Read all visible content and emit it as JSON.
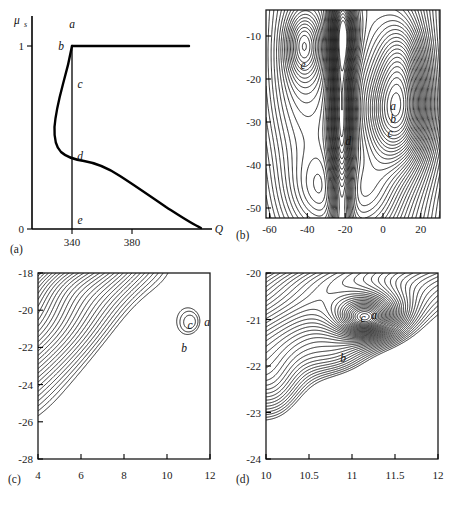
{
  "figure": {
    "panel_count": 4,
    "background": "#ffffff",
    "ink": "#1a1a1a"
  },
  "panels": {
    "a": {
      "tag": "(a)",
      "type": "line",
      "xlabel": "Q",
      "ylabel": "μ",
      "ylabel_sub": "s",
      "xticks": [
        "340",
        "380"
      ],
      "xtick_values": [
        340,
        380
      ],
      "yticks": [
        "0",
        "1"
      ],
      "ytick_values": [
        0,
        1
      ],
      "xlim": [
        300,
        420
      ],
      "ylim": [
        0,
        1.08
      ],
      "labels": [
        {
          "text": "a",
          "x": 340,
          "y": 1.06
        },
        {
          "text": "b",
          "x": 331,
          "y": 0.985
        },
        {
          "text": "c",
          "x": 344,
          "y": 0.8
        },
        {
          "text": "d",
          "x": 344,
          "y": 0.345
        },
        {
          "text": "e",
          "x": 344,
          "y": 0.055
        }
      ],
      "series": [
        {
          "name": "upper-branch-plateau",
          "comment": "mu_s = 1 plateau from Q=340 to right edge",
          "points": [
            [
              340,
              1.0
            ],
            [
              418,
              1.0
            ]
          ]
        },
        {
          "name": "s-shaped-solution-branch",
          "comment": "S-curve: from (340,1) descending left then right down to (413,0)",
          "points": [
            [
              340,
              1.0
            ],
            [
              338.6,
              0.95
            ],
            [
              336.5,
              0.88
            ],
            [
              334.5,
              0.82
            ],
            [
              332.0,
              0.755
            ],
            [
              329.5,
              0.68
            ],
            [
              327.8,
              0.6
            ],
            [
              326.8,
              0.52
            ],
            [
              326.6,
              0.455
            ],
            [
              327.4,
              0.41
            ],
            [
              329.2,
              0.375
            ],
            [
              332.0,
              0.352
            ],
            [
              335.5,
              0.337
            ],
            [
              340.0,
              0.327
            ],
            [
              345.5,
              0.305
            ],
            [
              351.0,
              0.277
            ],
            [
              357.0,
              0.245
            ],
            [
              363.5,
              0.212
            ],
            [
              370.5,
              0.178
            ],
            [
              378.0,
              0.143
            ],
            [
              386.0,
              0.11
            ],
            [
              394.0,
              0.078
            ],
            [
              401.5,
              0.049
            ],
            [
              407.5,
              0.026
            ],
            [
              411.5,
              0.01
            ],
            [
              413.5,
              0.0
            ]
          ]
        },
        {
          "name": "vertical-line-at-Q340",
          "comment": "vertical reference at Q = 340",
          "points": [
            [
              340,
              0.0
            ],
            [
              340,
              1.0
            ]
          ]
        }
      ]
    },
    "b": {
      "tag": "(b)",
      "type": "contour",
      "xlim": [
        -62,
        30
      ],
      "ylim": [
        -52,
        -4
      ],
      "xticks": [
        "-60",
        "-40",
        "-20",
        "0",
        "20"
      ],
      "xtick_values": [
        -60,
        -40,
        -20,
        0,
        20
      ],
      "yticks": [
        "-10",
        "-20",
        "-30",
        "-40",
        "-50"
      ],
      "ytick_values": [
        -10,
        -20,
        -30,
        -40,
        -50
      ],
      "labels": [
        {
          "text": "e",
          "x": -42.5,
          "y": -11.8
        },
        {
          "text": "a",
          "x": 7.5,
          "y": -21.5
        },
        {
          "text": "b",
          "x": 7.5,
          "y": -24.5
        },
        {
          "text": "c",
          "x": 6.0,
          "y": -27.8
        },
        {
          "text": "d",
          "x": -17.5,
          "y": -29.5
        }
      ]
    },
    "c": {
      "tag": "(c)",
      "type": "contour",
      "xlim": [
        4,
        12
      ],
      "ylim": [
        -28,
        -18
      ],
      "xticks": [
        "4",
        "6",
        "8",
        "10",
        "12"
      ],
      "xtick_values": [
        4,
        6,
        8,
        10,
        12
      ],
      "yticks": [
        "-18",
        "-20",
        "-22",
        "-24",
        "-26",
        "-28"
      ],
      "ytick_values": [
        -18,
        -20,
        -22,
        -24,
        -26,
        -28
      ],
      "labels": [
        {
          "text": "c",
          "x": 11.05,
          "y": -20.95
        },
        {
          "text": "a",
          "x": 11.85,
          "y": -20.8
        },
        {
          "text": "b",
          "x": 10.75,
          "y": -22.2
        }
      ]
    },
    "d": {
      "tag": "(d)",
      "type": "contour",
      "xlim": [
        10,
        12
      ],
      "ylim": [
        -24,
        -20
      ],
      "xticks": [
        "10",
        "10.5",
        "11",
        "11.5",
        "12"
      ],
      "xtick_values": [
        10,
        10.5,
        11,
        11.5,
        12
      ],
      "yticks": [
        "-20",
        "-21",
        "-22",
        "-23",
        "-24"
      ],
      "ytick_values": [
        -20,
        -21,
        -22,
        -23,
        -24
      ],
      "labels": [
        {
          "text": "c",
          "x": 11.13,
          "y": -20.93
        },
        {
          "text": "a",
          "x": 11.25,
          "y": -20.88
        },
        {
          "text": "b",
          "x": 10.9,
          "y": -21.78
        }
      ]
    }
  },
  "chart_data": [
    {
      "type": "line",
      "title": "(a)",
      "xlabel": "Q",
      "ylabel": "mu_s",
      "xlim": [
        300,
        420
      ],
      "ylim": [
        0,
        1.08
      ],
      "xticks": [
        340,
        380
      ],
      "yticks": [
        0,
        1
      ],
      "grid": false,
      "legend": "none",
      "annotations": [
        "a",
        "b",
        "c",
        "d",
        "e"
      ],
      "series": [
        {
          "name": "plateau",
          "x": [
            340,
            418
          ],
          "y": [
            1,
            1
          ]
        },
        {
          "name": "S-branch",
          "x": [
            340,
            326.6,
            340,
            370.5,
            413.5
          ],
          "y": [
            1.0,
            0.455,
            0.327,
            0.178,
            0.0
          ]
        },
        {
          "name": "Q=340 vertical",
          "x": [
            340,
            340
          ],
          "y": [
            0,
            1
          ]
        }
      ]
    },
    {
      "type": "contour",
      "title": "(b)",
      "xlabel": "",
      "ylabel": "",
      "xlim": [
        -62,
        30
      ],
      "ylim": [
        -52,
        -4
      ],
      "xticks": [
        -60,
        -40,
        -20,
        0,
        20
      ],
      "yticks": [
        -10,
        -20,
        -30,
        -40,
        -50
      ],
      "grid": false,
      "legend": "none",
      "annotations": [
        "e",
        "a",
        "b",
        "c",
        "d"
      ],
      "extrema": [
        {
          "label": "e",
          "x": -42.5,
          "y": -11.8,
          "kind": "local-extremum"
        },
        {
          "label": "a",
          "x": 7.5,
          "y": -21.5,
          "kind": "local-extremum"
        },
        {
          "label": "b",
          "x": 7.5,
          "y": -24.5,
          "kind": "local-extremum"
        },
        {
          "label": "c",
          "x": 6.0,
          "y": -27.8,
          "kind": "local-extremum"
        },
        {
          "label": "d",
          "x": -17.5,
          "y": -29.5,
          "kind": "saddle"
        }
      ]
    },
    {
      "type": "contour",
      "title": "(c)",
      "xlabel": "",
      "ylabel": "",
      "xlim": [
        4,
        12
      ],
      "ylim": [
        -28,
        -18
      ],
      "xticks": [
        4,
        6,
        8,
        10,
        12
      ],
      "yticks": [
        -28,
        -26,
        -24,
        -22,
        -20,
        -18
      ],
      "grid": false,
      "legend": "none",
      "annotations": [
        "c",
        "a",
        "b"
      ],
      "extrema": [
        {
          "label": "c",
          "x": 11.05,
          "y": -20.95,
          "kind": "local-extremum"
        },
        {
          "label": "a",
          "x": 11.85,
          "y": -20.8,
          "kind": "local-extremum"
        },
        {
          "label": "b",
          "x": 10.75,
          "y": -22.2,
          "kind": "saddle"
        }
      ]
    },
    {
      "type": "contour",
      "title": "(d)",
      "xlabel": "",
      "ylabel": "",
      "xlim": [
        10,
        12
      ],
      "ylim": [
        -24,
        -20
      ],
      "xticks": [
        10,
        10.5,
        11,
        11.5,
        12
      ],
      "yticks": [
        -24,
        -23,
        -22,
        -21,
        -20
      ],
      "grid": false,
      "legend": "none",
      "annotations": [
        "c",
        "a",
        "b"
      ],
      "extrema": [
        {
          "label": "c",
          "x": 11.13,
          "y": -20.93,
          "kind": "local-extremum"
        },
        {
          "label": "a",
          "x": 11.25,
          "y": -20.88,
          "kind": "local-extremum"
        },
        {
          "label": "b",
          "x": 10.9,
          "y": -21.78,
          "kind": "saddle"
        }
      ]
    }
  ]
}
